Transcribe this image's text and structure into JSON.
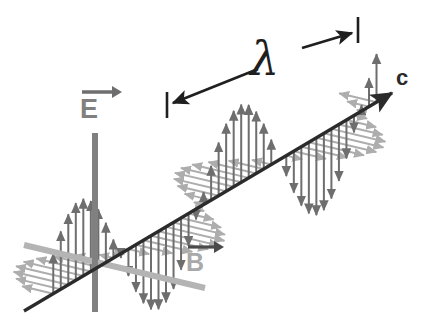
{
  "figure": {
    "type": "physics-diagram",
    "width": 428,
    "height": 324,
    "background": "#ffffff"
  },
  "labels": {
    "e_field": "E",
    "b_field": "B",
    "propagation": "c",
    "wavelength": "λ"
  },
  "colors": {
    "axis_c": "#2b2b2b",
    "axis_e": "#808080",
    "axis_b": "#b4b4b4",
    "e_arrows": "#6e6e6e",
    "b_arrows": "#adadad",
    "lambda_arrow": "#1f1f1f",
    "label_e": "#808080",
    "label_b": "#a9a9a9",
    "label_c": "#2b2b2b",
    "background": "#ffffff"
  },
  "geometry": {
    "origin": {
      "x": 95,
      "y": 265
    },
    "c_axis": {
      "x1": 24,
      "y1": 311,
      "x2": 392,
      "y2": 93,
      "arrowhead": true
    },
    "e_axis": {
      "x1": 95,
      "y1": 133,
      "x2": 95,
      "y2": 312,
      "width": 6
    },
    "b_axis": {
      "x1": 24,
      "y1": 245,
      "x2": 205,
      "y2": 288,
      "width": 6
    },
    "wave_axis_angle_deg": -30.6,
    "b_skew": {
      "dx": -76,
      "dy": -18
    },
    "e_amplitude_px": 78,
    "b_amplitude_px": 62,
    "wavelength_px": 186,
    "phase_offset_px": 18,
    "arrow_count": 44,
    "lambda_marker": {
      "left_tick": {
        "x": 167,
        "y": 105
      },
      "right_tick": {
        "x": 358,
        "y": 30
      },
      "double_headed": true
    }
  },
  "chart_data": {
    "type": "line",
    "xlabel": "c",
    "ylabel": "E",
    "zlabel": "B",
    "series": [
      {
        "name": "E",
        "direction": "vertical",
        "phase_deg": 0,
        "amplitude": 1
      },
      {
        "name": "B",
        "direction": "transverse",
        "phase_deg": 0,
        "amplitude": 0.8
      }
    ],
    "annotations": [
      "λ"
    ],
    "grid": false,
    "legend": "none"
  }
}
